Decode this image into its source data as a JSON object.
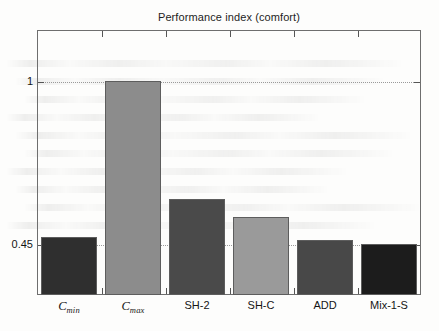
{
  "chart_data": {
    "type": "bar",
    "title": "Performance index (comfort)",
    "xlabel": "",
    "ylabel": "",
    "categories": [
      "C_min",
      "C_max",
      "SH-2",
      "SH-C",
      "ADD",
      "Mix-1-S"
    ],
    "category_labels": [
      {
        "base": "C",
        "sub": "min",
        "italic": true,
        "text": "Cmin"
      },
      {
        "base": "C",
        "sub": "max",
        "italic": true,
        "text": "Cmax"
      },
      {
        "base": "SH-2",
        "sub": "",
        "italic": false,
        "text": "SH-2"
      },
      {
        "base": "SH-C",
        "sub": "",
        "italic": false,
        "text": "SH-C"
      },
      {
        "base": "ADD",
        "sub": "",
        "italic": false,
        "text": "ADD"
      },
      {
        "base": "Mix-1-S",
        "sub": "",
        "italic": false,
        "text": "Mix-1-S"
      }
    ],
    "values": [
      0.474,
      1.0,
      0.602,
      0.542,
      0.466,
      0.45
    ],
    "bar_colors": [
      "#2f2f2f",
      "#8c8c8c",
      "#4a4a4a",
      "#9a9a9a",
      "#484848",
      "#1c1c1c"
    ],
    "ylim": [
      0.28,
      1.17
    ],
    "yticks": [
      1,
      0.45
    ],
    "ytick_labels": [
      "1",
      "0.45"
    ],
    "grid": true,
    "grid_style": "dotted",
    "legend": "none",
    "axis_box": true,
    "edge_color": "#5d5d5d"
  },
  "figure": {
    "background": "#fdfdfc",
    "axis_color": "#6e6e6e",
    "grid_color": "#9a9a9a",
    "text_color": "#151515"
  }
}
